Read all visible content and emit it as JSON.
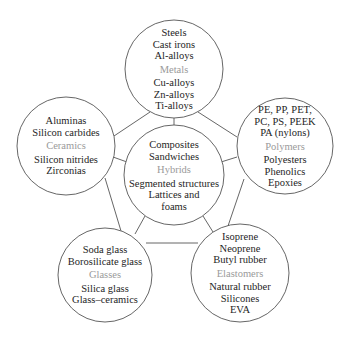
{
  "diagram": {
    "line_color": "#555555",
    "text_color": "#1e1e1e",
    "category_color": "#9a9a9a",
    "nodes": [
      {
        "id": "metals",
        "category": "Metals",
        "cx": 174,
        "cy": 69,
        "r": 49,
        "items_before": [
          "Steels",
          "Cast irons",
          "Al-alloys"
        ],
        "items_after": [
          "Cu-alloys",
          "Zn-alloys",
          "Ti-alloys"
        ]
      },
      {
        "id": "ceramics",
        "category": "Ceramics",
        "cx": 66,
        "cy": 146,
        "r": 49,
        "items_before": [
          "Aluminas",
          "Silicon carbides"
        ],
        "items_after": [
          "Silicon nitrides",
          "Zirconias"
        ]
      },
      {
        "id": "polymers",
        "category": "Polymers",
        "cx": 285,
        "cy": 146,
        "r": 48,
        "items_before": [
          "PE, PP, PET,",
          "PC, PS, PEEK",
          "PA (nylons)"
        ],
        "items_after": [
          "Polyesters",
          "Phenolics",
          "Epoxies"
        ]
      },
      {
        "id": "hybrids",
        "category": "Hybrids",
        "cx": 174,
        "cy": 175,
        "r": 50,
        "items_before": [
          "Composites",
          "Sandwiches"
        ],
        "items_after": [
          "Segmented structures",
          "Lattices and",
          "foams"
        ]
      },
      {
        "id": "glasses",
        "category": "Glasses",
        "cx": 105,
        "cy": 275,
        "r": 47,
        "items_before": [
          "Soda glass",
          "Borosilicate glass"
        ],
        "items_after": [
          "Silica glass",
          "Glass–ceramics"
        ]
      },
      {
        "id": "elastomers",
        "category": "Elastomers",
        "cx": 240,
        "cy": 273,
        "r": 49,
        "items_before": [
          "Isoprene",
          "Neoprene",
          "Butyl rubber"
        ],
        "items_after": [
          "Natural rubber",
          "Silicones",
          "EVA"
        ]
      }
    ],
    "links": [
      {
        "from": "metals",
        "to": "hybrids",
        "x1": 174,
        "y1": 118,
        "x2": 174,
        "y2": 125
      },
      {
        "from": "metals",
        "to": "ceramics",
        "x1": 150,
        "y1": 112,
        "x2": 114,
        "y2": 136
      },
      {
        "from": "metals",
        "to": "polymers",
        "x1": 198,
        "y1": 112,
        "x2": 237,
        "y2": 137
      },
      {
        "from": "ceramics",
        "to": "hybrids",
        "x1": 113,
        "y1": 157,
        "x2": 127,
        "y2": 162
      },
      {
        "from": "polymers",
        "to": "hybrids",
        "x1": 237,
        "y1": 157,
        "x2": 221,
        "y2": 162
      },
      {
        "from": "ceramics",
        "to": "glasses",
        "x1": 105,
        "y1": 178,
        "x2": 121,
        "y2": 231
      },
      {
        "from": "polymers",
        "to": "elastomers",
        "x1": 244,
        "y1": 179,
        "x2": 228,
        "y2": 226
      },
      {
        "from": "hybrids",
        "to": "glasses",
        "x1": 145,
        "y1": 216,
        "x2": 135,
        "y2": 234
      },
      {
        "from": "hybrids",
        "to": "elastomers",
        "x1": 203,
        "y1": 216,
        "x2": 213,
        "y2": 232
      },
      {
        "from": "glasses",
        "to": "elastomers",
        "x1": 146,
        "y1": 243,
        "x2": 198,
        "y2": 243
      }
    ]
  }
}
